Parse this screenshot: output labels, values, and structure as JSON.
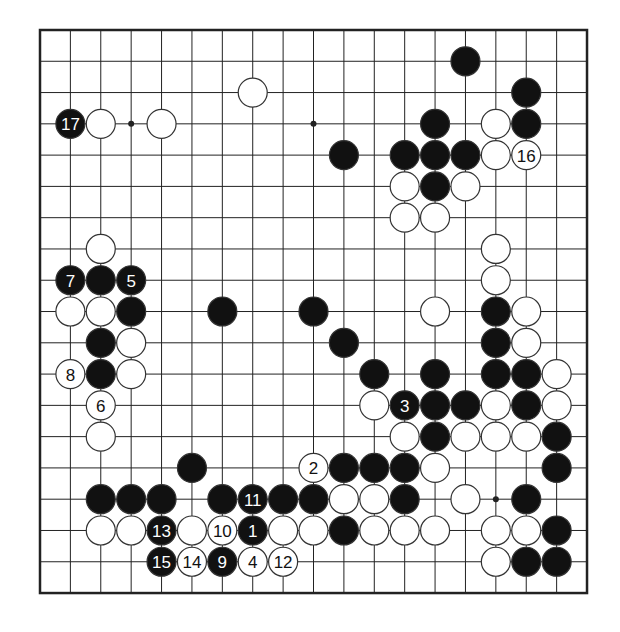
{
  "board": {
    "size": 19,
    "origin": {
      "x": 40,
      "y": 30
    },
    "spacing": {
      "x": 30.39,
      "y": 31.28
    },
    "colors": {
      "line": "#222222",
      "black": "#111111",
      "white": "#ffffff",
      "stone_edge": "#333333",
      "background": "#ffffff"
    },
    "star_points": [
      [
        3,
        3
      ],
      [
        9,
        3
      ],
      [
        15,
        15
      ]
    ],
    "black_stones": [
      {
        "c": 14,
        "r": 1
      },
      {
        "c": 16,
        "r": 2
      },
      {
        "c": 1,
        "r": 3,
        "n": "17"
      },
      {
        "c": 13,
        "r": 3
      },
      {
        "c": 16,
        "r": 3
      },
      {
        "c": 10,
        "r": 4
      },
      {
        "c": 12,
        "r": 4
      },
      {
        "c": 13,
        "r": 4
      },
      {
        "c": 14,
        "r": 4
      },
      {
        "c": 13,
        "r": 5
      },
      {
        "c": 1,
        "r": 8,
        "n": "7"
      },
      {
        "c": 2,
        "r": 8
      },
      {
        "c": 3,
        "r": 8,
        "n": "5"
      },
      {
        "c": 3,
        "r": 9
      },
      {
        "c": 6,
        "r": 9
      },
      {
        "c": 9,
        "r": 9
      },
      {
        "c": 15,
        "r": 9
      },
      {
        "c": 2,
        "r": 10
      },
      {
        "c": 10,
        "r": 10
      },
      {
        "c": 15,
        "r": 10
      },
      {
        "c": 2,
        "r": 11
      },
      {
        "c": 11,
        "r": 11
      },
      {
        "c": 13,
        "r": 11
      },
      {
        "c": 15,
        "r": 11
      },
      {
        "c": 16,
        "r": 11
      },
      {
        "c": 12,
        "r": 12,
        "n": "3"
      },
      {
        "c": 13,
        "r": 12
      },
      {
        "c": 14,
        "r": 12
      },
      {
        "c": 16,
        "r": 12
      },
      {
        "c": 13,
        "r": 13
      },
      {
        "c": 17,
        "r": 13
      },
      {
        "c": 5,
        "r": 14
      },
      {
        "c": 10,
        "r": 14
      },
      {
        "c": 11,
        "r": 14
      },
      {
        "c": 12,
        "r": 14
      },
      {
        "c": 17,
        "r": 14
      },
      {
        "c": 2,
        "r": 15
      },
      {
        "c": 3,
        "r": 15
      },
      {
        "c": 4,
        "r": 15
      },
      {
        "c": 6,
        "r": 15
      },
      {
        "c": 7,
        "r": 15,
        "n": "11"
      },
      {
        "c": 8,
        "r": 15
      },
      {
        "c": 9,
        "r": 15
      },
      {
        "c": 12,
        "r": 15
      },
      {
        "c": 16,
        "r": 15
      },
      {
        "c": 4,
        "r": 16,
        "n": "13"
      },
      {
        "c": 7,
        "r": 16,
        "n": "1"
      },
      {
        "c": 10,
        "r": 16
      },
      {
        "c": 17,
        "r": 16
      },
      {
        "c": 4,
        "r": 17,
        "n": "15"
      },
      {
        "c": 6,
        "r": 17,
        "n": "9"
      },
      {
        "c": 16,
        "r": 17
      },
      {
        "c": 17,
        "r": 17
      }
    ],
    "white_stones": [
      {
        "c": 7,
        "r": 2
      },
      {
        "c": 2,
        "r": 3
      },
      {
        "c": 4,
        "r": 3
      },
      {
        "c": 15,
        "r": 3
      },
      {
        "c": 15,
        "r": 4
      },
      {
        "c": 16,
        "r": 4,
        "n": "16"
      },
      {
        "c": 12,
        "r": 5
      },
      {
        "c": 14,
        "r": 5
      },
      {
        "c": 12,
        "r": 6
      },
      {
        "c": 13,
        "r": 6
      },
      {
        "c": 2,
        "r": 7
      },
      {
        "c": 15,
        "r": 7
      },
      {
        "c": 15,
        "r": 8
      },
      {
        "c": 1,
        "r": 9
      },
      {
        "c": 2,
        "r": 9
      },
      {
        "c": 13,
        "r": 9
      },
      {
        "c": 16,
        "r": 9
      },
      {
        "c": 3,
        "r": 10
      },
      {
        "c": 16,
        "r": 10
      },
      {
        "c": 1,
        "r": 11,
        "n": "8"
      },
      {
        "c": 3,
        "r": 11
      },
      {
        "c": 17,
        "r": 11
      },
      {
        "c": 2,
        "r": 12,
        "n": "6"
      },
      {
        "c": 11,
        "r": 12
      },
      {
        "c": 15,
        "r": 12
      },
      {
        "c": 17,
        "r": 12
      },
      {
        "c": 2,
        "r": 13
      },
      {
        "c": 12,
        "r": 13
      },
      {
        "c": 14,
        "r": 13
      },
      {
        "c": 15,
        "r": 13
      },
      {
        "c": 16,
        "r": 13
      },
      {
        "c": 9,
        "r": 14,
        "n": "2"
      },
      {
        "c": 13,
        "r": 14
      },
      {
        "c": 10,
        "r": 15
      },
      {
        "c": 11,
        "r": 15
      },
      {
        "c": 14,
        "r": 15
      },
      {
        "c": 2,
        "r": 16
      },
      {
        "c": 3,
        "r": 16
      },
      {
        "c": 5,
        "r": 16
      },
      {
        "c": 6,
        "r": 16,
        "n": "10"
      },
      {
        "c": 8,
        "r": 16
      },
      {
        "c": 9,
        "r": 16
      },
      {
        "c": 11,
        "r": 16
      },
      {
        "c": 12,
        "r": 16
      },
      {
        "c": 13,
        "r": 16
      },
      {
        "c": 15,
        "r": 16
      },
      {
        "c": 16,
        "r": 16
      },
      {
        "c": 5,
        "r": 17,
        "n": "14"
      },
      {
        "c": 7,
        "r": 17,
        "n": "4"
      },
      {
        "c": 8,
        "r": 17,
        "n": "12"
      },
      {
        "c": 15,
        "r": 17
      }
    ]
  }
}
